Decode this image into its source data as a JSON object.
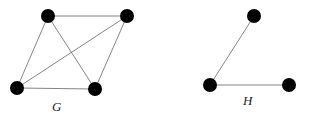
{
  "graphs": [
    {
      "name": "G",
      "label": "G",
      "label_pos": [
        52,
        111
      ],
      "nodes": [
        {
          "id": "g1",
          "x": 48,
          "y": 16
        },
        {
          "id": "g2",
          "x": 127,
          "y": 16
        },
        {
          "id": "g3",
          "x": 17,
          "y": 88
        },
        {
          "id": "g4",
          "x": 95,
          "y": 89
        }
      ],
      "edges": [
        [
          "g1",
          "g2"
        ],
        [
          "g1",
          "g3"
        ],
        [
          "g1",
          "g4"
        ],
        [
          "g2",
          "g3"
        ],
        [
          "g2",
          "g4"
        ],
        [
          "g3",
          "g4"
        ]
      ]
    },
    {
      "name": "H",
      "label": "H",
      "label_pos": [
        243,
        105
      ],
      "nodes": [
        {
          "id": "h1",
          "x": 254,
          "y": 16
        },
        {
          "id": "h2",
          "x": 210,
          "y": 85
        },
        {
          "id": "h3",
          "x": 289,
          "y": 85
        }
      ],
      "edges": [
        [
          "h1",
          "h2"
        ],
        [
          "h2",
          "h3"
        ]
      ]
    }
  ],
  "style": {
    "node_radius": 7,
    "node_color": "#000000",
    "edge_color": "#777777"
  }
}
